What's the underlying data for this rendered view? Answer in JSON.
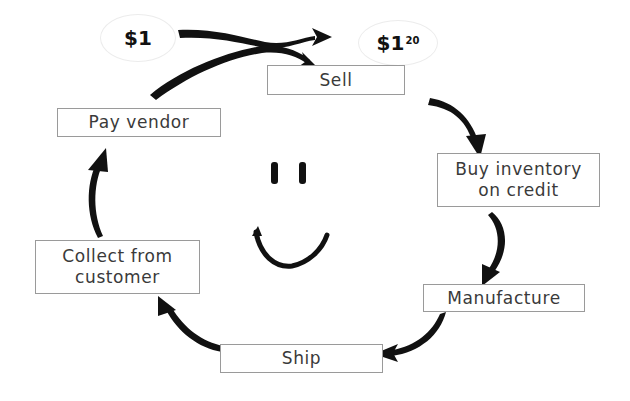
{
  "diagram": {
    "type": "cycle",
    "money": {
      "start": {
        "symbol": "$",
        "whole": "1",
        "cents": ""
      },
      "end": {
        "symbol": "$",
        "whole": "1",
        "cents": "20"
      }
    },
    "steps": [
      {
        "id": "sell",
        "lines": [
          "Sell"
        ]
      },
      {
        "id": "buy-inventory",
        "lines": [
          "Buy inventory",
          "on credit"
        ]
      },
      {
        "id": "manufacture",
        "lines": [
          "Manufacture"
        ]
      },
      {
        "id": "ship",
        "lines": [
          "Ship"
        ]
      },
      {
        "id": "collect",
        "lines": [
          "Collect from",
          "customer"
        ]
      },
      {
        "id": "pay-vendor",
        "lines": [
          "Pay vendor"
        ]
      }
    ],
    "flow": [
      [
        "pay-vendor",
        "sell"
      ],
      [
        "start",
        "end"
      ],
      [
        "sell",
        "buy-inventory"
      ],
      [
        "buy-inventory",
        "manufacture"
      ],
      [
        "manufacture",
        "ship"
      ],
      [
        "ship",
        "collect"
      ],
      [
        "collect",
        "pay-vendor"
      ]
    ],
    "center_graphic": "smiley-face",
    "colors": {
      "arrow": "#111111",
      "box_border": "#8a8a8a",
      "text": "#3a3a3a"
    }
  }
}
